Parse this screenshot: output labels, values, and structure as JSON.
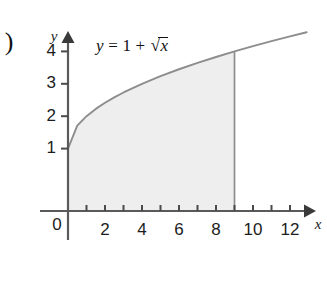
{
  "figure": {
    "problem_marker": ")",
    "equation": {
      "lhs": "y",
      "equals": "=",
      "constant": "1",
      "plus": "+",
      "radical_sign": "√",
      "radicand": "x",
      "full_text": "y = 1 + √x"
    },
    "axis_label_x": "x",
    "axis_label_y": "y",
    "zero_label": "0",
    "colors": {
      "shaded_region": "#eeeeee",
      "curve": "#8d8d8d",
      "axis": "#5a5a5a",
      "text": "#1c1c1c",
      "background": "#ffffff"
    }
  },
  "chart_data": {
    "type": "line",
    "title": "",
    "subtitle": "",
    "xlabel": "x",
    "ylabel": "y",
    "annotations": [
      "y = 1 + √x"
    ],
    "legend": [],
    "grid": false,
    "xlim": [
      0,
      13
    ],
    "ylim": [
      0,
      4.6
    ],
    "x_ticks": [
      2,
      4,
      6,
      8,
      10,
      12
    ],
    "x_tick_labels": [
      "2",
      "4",
      "6",
      "8",
      "10",
      "12"
    ],
    "x_minor_ticks": [
      1,
      2,
      3,
      4,
      5,
      6,
      7,
      8,
      9,
      10,
      11,
      12
    ],
    "y_ticks": [
      1,
      2,
      3,
      4
    ],
    "y_tick_labels": [
      "1",
      "2",
      "3",
      "4"
    ],
    "origin_label": "0",
    "series": [
      {
        "name": "y = 1 + √x",
        "function": "1 + sqrt(x)",
        "x": [
          0,
          0.5,
          1,
          1.5,
          2,
          2.5,
          3,
          4,
          5,
          6,
          7,
          8,
          9,
          10,
          11,
          12,
          12.9
        ],
        "values": [
          1,
          1.707,
          2,
          2.225,
          2.414,
          2.581,
          2.732,
          3,
          3.236,
          3.449,
          3.646,
          3.828,
          4,
          4.162,
          4.317,
          4.464,
          4.592
        ]
      }
    ],
    "shaded_region": {
      "label": "area under curve",
      "x_from": 0,
      "x_to": 9,
      "y_from": 0,
      "curve": "1 + sqrt(x)",
      "fill": "#eeeeee"
    }
  }
}
